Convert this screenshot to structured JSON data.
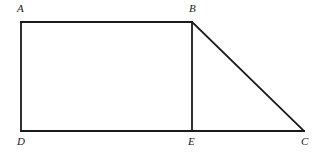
{
  "figure": {
    "background_color": "#ffffff",
    "stroke_color": "#1a1a1a",
    "stroke_width": 1.8,
    "vertices": [
      {
        "id": "A",
        "label": "A",
        "x": 21,
        "y": 22,
        "label_x": 17,
        "label_y": 3
      },
      {
        "id": "B",
        "label": "B",
        "x": 192,
        "y": 22,
        "label_x": 189,
        "label_y": 3
      },
      {
        "id": "C",
        "label": "C",
        "x": 304,
        "y": 131,
        "label_x": 301,
        "label_y": 136
      },
      {
        "id": "D",
        "label": "D",
        "x": 21,
        "y": 131,
        "label_x": 17,
        "label_y": 136
      },
      {
        "id": "E",
        "label": "E",
        "x": 192,
        "y": 131,
        "label_x": 188,
        "label_y": 136
      }
    ],
    "segments": [
      {
        "name": "AB",
        "from": "A",
        "to": "B",
        "x1": 21,
        "y1": 22,
        "x2": 192,
        "y2": 22
      },
      {
        "name": "BC",
        "from": "B",
        "to": "C",
        "x1": 192,
        "y1": 22,
        "x2": 304,
        "y2": 131
      },
      {
        "name": "DC",
        "from": "D",
        "to": "C",
        "x1": 21,
        "y1": 131,
        "x2": 304,
        "y2": 131
      },
      {
        "name": "AD",
        "from": "A",
        "to": "D",
        "x1": 21,
        "y1": 22,
        "x2": 21,
        "y2": 131
      },
      {
        "name": "BE",
        "from": "B",
        "to": "E",
        "x1": 192,
        "y1": 22,
        "x2": 192,
        "y2": 131
      }
    ]
  }
}
